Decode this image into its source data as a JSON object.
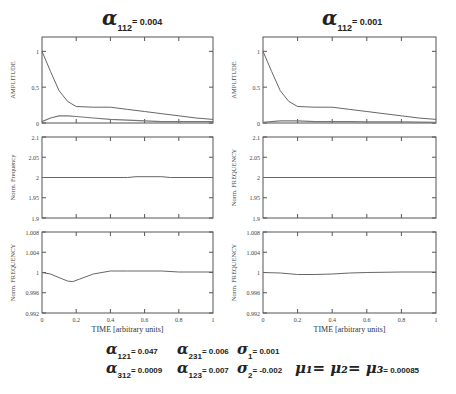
{
  "titles": {
    "left": {
      "symbol": "α",
      "subscript": "112",
      "value": "= 0.004"
    },
    "right": {
      "symbol": "α",
      "subscript": "112",
      "value": "= 0.001"
    }
  },
  "axis_labels": {
    "amplitude": "AMPLITUDE",
    "norm_frequency_mixed": "Norm. Frequency",
    "norm_frequency_upper": "Norm. FREQUENCY",
    "time": "TIME [arbitrary units]"
  },
  "ticks": {
    "x": [
      "0",
      "0.2",
      "0.4",
      "0.6",
      "0.8",
      "1"
    ],
    "amplitude": [
      "0",
      "0.5",
      "1"
    ],
    "freq2": [
      "1.9",
      "1.95",
      "2",
      "2.05",
      "2.1"
    ],
    "freq1": [
      "0.992",
      "0.996",
      "1",
      "1.004",
      "1.008"
    ]
  },
  "parameters": [
    {
      "symbol": "α",
      "subscript": "121",
      "value": "= 0.047"
    },
    {
      "symbol": "α",
      "subscript": "231",
      "value": "= 0.006"
    },
    {
      "symbol": "σ",
      "subscript": "1",
      "value": "= 0.001"
    },
    {
      "symbol": "α",
      "subscript": "312",
      "value": "= 0.0009"
    },
    {
      "symbol": "α",
      "subscript": "123",
      "value": "= 0.007"
    },
    {
      "symbol": "σ",
      "subscript": "2",
      "value": "= -0.002"
    },
    {
      "symbol": "μ₁= μ₂= μ₃",
      "subscript": "",
      "value": "= 0.00085"
    }
  ],
  "chart_data": [
    {
      "type": "line",
      "panel": "left-top",
      "title": "α112 = 0.004",
      "xlabel": "",
      "ylabel": "AMPLITUDE",
      "xlim": [
        0,
        1
      ],
      "ylim": [
        0,
        1.2
      ],
      "series": [
        {
          "name": "mode A",
          "x": [
            0,
            0.05,
            0.1,
            0.15,
            0.2,
            0.3,
            0.4,
            0.5,
            0.6,
            0.7,
            0.8,
            0.9,
            1.0
          ],
          "values": [
            1.0,
            0.72,
            0.45,
            0.3,
            0.23,
            0.22,
            0.22,
            0.19,
            0.16,
            0.13,
            0.1,
            0.07,
            0.05
          ]
        },
        {
          "name": "mode B",
          "x": [
            0,
            0.05,
            0.1,
            0.15,
            0.2,
            0.3,
            0.4,
            0.5,
            0.6,
            0.7,
            0.8,
            0.9,
            1.0
          ],
          "values": [
            0.02,
            0.07,
            0.1,
            0.1,
            0.09,
            0.07,
            0.05,
            0.04,
            0.03,
            0.02,
            0.02,
            0.02,
            0.02
          ]
        }
      ]
    },
    {
      "type": "line",
      "panel": "left-middle",
      "ylabel": "Norm. Frequency",
      "xlim": [
        0,
        1
      ],
      "ylim": [
        1.9,
        2.1
      ],
      "series": [
        {
          "name": "freq",
          "x": [
            0,
            0.5,
            0.55,
            0.7,
            0.75,
            1.0
          ],
          "values": [
            2.0,
            2.0,
            2.002,
            2.002,
            2.0,
            2.0
          ]
        }
      ]
    },
    {
      "type": "line",
      "panel": "left-bottom",
      "xlabel": "TIME [arbitrary units]",
      "ylabel": "Norm. FREQUENCY",
      "xlim": [
        0,
        1
      ],
      "ylim": [
        0.992,
        1.008
      ],
      "series": [
        {
          "name": "freq",
          "x": [
            0,
            0.05,
            0.1,
            0.15,
            0.18,
            0.22,
            0.3,
            0.4,
            0.5,
            0.7,
            0.8,
            1.0
          ],
          "values": [
            1.0,
            0.9997,
            0.999,
            0.9983,
            0.9982,
            0.9987,
            0.9997,
            1.0003,
            1.0003,
            1.0003,
            1.0001,
            1.0001
          ]
        }
      ]
    },
    {
      "type": "line",
      "panel": "right-top",
      "title": "α112 = 0.001",
      "ylabel": "AMPLITUDE",
      "xlim": [
        0,
        1
      ],
      "ylim": [
        0,
        1.2
      ],
      "series": [
        {
          "name": "mode A",
          "x": [
            0,
            0.05,
            0.1,
            0.15,
            0.2,
            0.3,
            0.4,
            0.5,
            0.6,
            0.7,
            0.8,
            0.9,
            1.0
          ],
          "values": [
            1.0,
            0.72,
            0.45,
            0.3,
            0.23,
            0.22,
            0.22,
            0.19,
            0.16,
            0.13,
            0.1,
            0.07,
            0.05
          ]
        },
        {
          "name": "mode B",
          "x": [
            0,
            0.05,
            0.1,
            0.2,
            0.3,
            0.5,
            0.6,
            0.8,
            1.0
          ],
          "values": [
            0.01,
            0.02,
            0.03,
            0.03,
            0.02,
            0.02,
            0.015,
            0.015,
            0.01
          ]
        }
      ]
    },
    {
      "type": "line",
      "panel": "right-middle",
      "ylabel": "Norm. FREQUENCY",
      "xlim": [
        0,
        1
      ],
      "ylim": [
        1.9,
        2.1
      ],
      "series": [
        {
          "name": "freq",
          "x": [
            0,
            1.0
          ],
          "values": [
            2.0,
            2.0
          ]
        }
      ]
    },
    {
      "type": "line",
      "panel": "right-bottom",
      "xlabel": "TIME [arbitrary units]",
      "ylabel": "Norm. FREQUENCY",
      "xlim": [
        0,
        1
      ],
      "ylim": [
        0.992,
        1.008
      ],
      "series": [
        {
          "name": "freq",
          "x": [
            0,
            0.1,
            0.2,
            0.3,
            0.4,
            0.5,
            0.6,
            0.8,
            1.0
          ],
          "values": [
            1.0,
            0.9999,
            0.9996,
            0.9996,
            0.9997,
            0.9999,
            1.0,
            1.0001,
            1.0001
          ]
        }
      ]
    }
  ]
}
